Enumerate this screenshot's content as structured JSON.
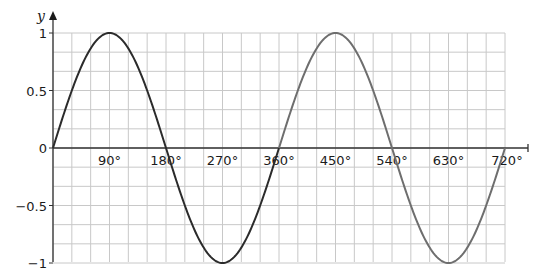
{
  "chart_data": {
    "type": "line",
    "title": "",
    "xlabel": "",
    "ylabel": "y",
    "xlim": [
      0,
      720
    ],
    "ylim": [
      -1,
      1
    ],
    "grid": true,
    "grid_step_x": 30,
    "grid_step_y": 0.16667,
    "x_ticks": [
      {
        "value": 90,
        "label": "90°"
      },
      {
        "value": 180,
        "label": "180°"
      },
      {
        "value": 270,
        "label": "270°"
      },
      {
        "value": 360,
        "label": "360°"
      },
      {
        "value": 450,
        "label": "450°"
      },
      {
        "value": 540,
        "label": "540°"
      },
      {
        "value": 630,
        "label": "630°"
      },
      {
        "value": 720,
        "label": "720°"
      }
    ],
    "y_ticks": [
      {
        "value": 1,
        "label": "1"
      },
      {
        "value": 0.5,
        "label": "0.5"
      },
      {
        "value": 0,
        "label": "0"
      },
      {
        "value": -0.5,
        "label": "−0.5"
      },
      {
        "value": -1,
        "label": "−1"
      }
    ],
    "series": [
      {
        "name": "y = sin x (0°–360°)",
        "function": "sin",
        "x_range": [
          0,
          360
        ],
        "color": "#2b2b2b",
        "x": [
          0,
          90,
          180,
          270,
          360
        ],
        "values": [
          0,
          1,
          0,
          -1,
          0
        ]
      },
      {
        "name": "y = sin x (360°–720°)",
        "function": "sin",
        "x_range": [
          360,
          720
        ],
        "color": "#6e6e6e",
        "x": [
          360,
          450,
          540,
          630,
          720
        ],
        "values": [
          0,
          1,
          0,
          -1,
          0
        ]
      }
    ],
    "legend": null
  },
  "colors": {
    "grid": "#c8c8c8",
    "axis": "#333333"
  }
}
